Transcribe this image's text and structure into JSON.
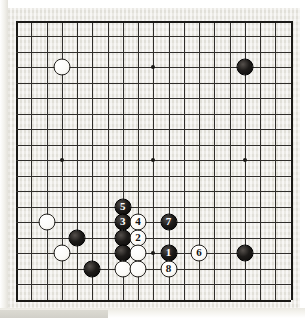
{
  "app": {
    "title": "Go Board Diagram",
    "description": "19x19 go board joseki / fighting sequence diagram, moves 1-8 numbered"
  },
  "board": {
    "size": 19,
    "board_color": "#e9e7e0",
    "line_color": "#302e2b",
    "black_color": "#0a0908",
    "white_color": "#fbfaf7",
    "hoshi_points": [
      {
        "col": 3,
        "row": 3
      },
      {
        "col": 9,
        "row": 3
      },
      {
        "col": 15,
        "row": 3
      },
      {
        "col": 3,
        "row": 9
      },
      {
        "col": 9,
        "row": 9
      },
      {
        "col": 15,
        "row": 9
      },
      {
        "col": 3,
        "row": 15
      },
      {
        "col": 9,
        "row": 15
      },
      {
        "col": 15,
        "row": 15
      }
    ],
    "stones": [
      {
        "col": 3,
        "row": 3,
        "color": "white",
        "label": "",
        "name": "white-stone-d16"
      },
      {
        "col": 15,
        "row": 3,
        "color": "black",
        "label": "",
        "name": "black-stone-q16"
      },
      {
        "col": 2,
        "row": 13,
        "color": "white",
        "label": "",
        "name": "white-stone-c6"
      },
      {
        "col": 4,
        "row": 14,
        "color": "black",
        "label": "",
        "name": "black-stone-e5"
      },
      {
        "col": 3,
        "row": 15,
        "color": "white",
        "label": "",
        "name": "white-stone-d4"
      },
      {
        "col": 5,
        "row": 16,
        "color": "black",
        "label": "",
        "name": "black-stone-f3"
      },
      {
        "col": 7,
        "row": 12,
        "color": "black",
        "label": "5",
        "name": "black-move-5"
      },
      {
        "col": 7,
        "row": 13,
        "color": "black",
        "label": "3",
        "name": "black-move-3"
      },
      {
        "col": 8,
        "row": 13,
        "color": "white",
        "label": "4",
        "name": "white-move-4"
      },
      {
        "col": 7,
        "row": 14,
        "color": "black",
        "label": "",
        "name": "black-stone-h5"
      },
      {
        "col": 8,
        "row": 14,
        "color": "white",
        "label": "2",
        "name": "white-move-2"
      },
      {
        "col": 7,
        "row": 15,
        "color": "black",
        "label": "",
        "name": "black-stone-h4"
      },
      {
        "col": 8,
        "row": 15,
        "color": "white",
        "label": "",
        "name": "white-stone-j4"
      },
      {
        "col": 7,
        "row": 16,
        "color": "white",
        "label": "",
        "name": "white-stone-h3"
      },
      {
        "col": 8,
        "row": 16,
        "color": "white",
        "label": "",
        "name": "white-stone-j3"
      },
      {
        "col": 10,
        "row": 13,
        "color": "black",
        "label": "7",
        "name": "black-move-7"
      },
      {
        "col": 10,
        "row": 15,
        "color": "black",
        "label": "1",
        "name": "black-move-1"
      },
      {
        "col": 10,
        "row": 16,
        "color": "white",
        "label": "8",
        "name": "white-move-8"
      },
      {
        "col": 12,
        "row": 15,
        "color": "white",
        "label": "6",
        "name": "white-move-6"
      },
      {
        "col": 15,
        "row": 15,
        "color": "black",
        "label": "",
        "name": "black-stone-q4"
      }
    ]
  }
}
